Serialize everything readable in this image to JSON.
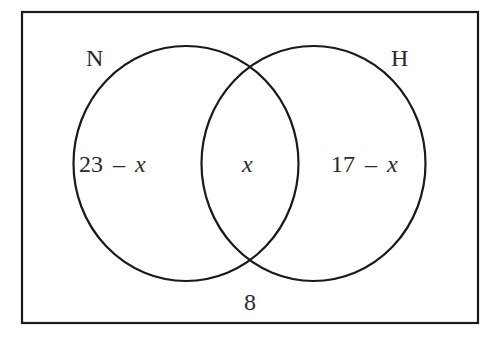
{
  "diagram": {
    "type": "venn",
    "universal_set": {
      "outside_value": "8"
    },
    "sets": [
      {
        "name": "N",
        "label": "N"
      },
      {
        "name": "H",
        "label": "H"
      }
    ],
    "regions": {
      "n_only": {
        "number": "23",
        "operator": "–",
        "variable": "x"
      },
      "intersection": {
        "variable": "x"
      },
      "h_only": {
        "number": "17",
        "operator": "–",
        "variable": "x"
      },
      "outside": "8"
    },
    "colors": {
      "stroke": "#1a1a1a",
      "text": "#2a2a2a",
      "background": "#ffffff"
    }
  }
}
